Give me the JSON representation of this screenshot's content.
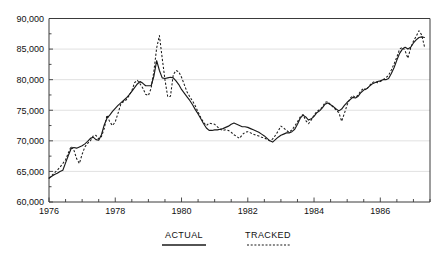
{
  "chart_data": {
    "type": "line",
    "title": "",
    "subtitle": "",
    "xlabel": "",
    "ylabel": "",
    "grid": true,
    "legend_position": "bottom",
    "ylim": [
      60000,
      90000
    ],
    "yticks": [
      60000,
      65000,
      70000,
      75000,
      80000,
      85000,
      90000
    ],
    "ytick_labels": [
      "60,000",
      "65,000",
      "70,000",
      "75,000",
      "80,000",
      "85,000",
      "90,000"
    ],
    "xlim": [
      1976.0,
      1987.5
    ],
    "xticks": [
      1976,
      1978,
      1980,
      1982,
      1984,
      1986
    ],
    "xtick_labels": [
      "1976",
      "1978",
      "1980",
      "1982",
      "1984",
      "1986"
    ],
    "xtick_minor_interval": 0.5,
    "x": [
      1976.0,
      1976.083,
      1976.167,
      1976.25,
      1976.333,
      1976.417,
      1976.5,
      1976.583,
      1976.667,
      1976.75,
      1976.833,
      1976.917,
      1977.0,
      1977.083,
      1977.167,
      1977.25,
      1977.333,
      1977.417,
      1977.5,
      1977.583,
      1977.667,
      1977.75,
      1977.833,
      1977.917,
      1978.0,
      1978.083,
      1978.167,
      1978.25,
      1978.333,
      1978.417,
      1978.5,
      1978.583,
      1978.667,
      1978.75,
      1978.833,
      1978.917,
      1979.0,
      1979.083,
      1979.167,
      1979.25,
      1979.333,
      1979.417,
      1979.5,
      1979.583,
      1979.667,
      1979.75,
      1979.833,
      1979.917,
      1980.0,
      1980.083,
      1980.167,
      1980.25,
      1980.333,
      1980.417,
      1980.5,
      1980.583,
      1980.667,
      1980.75,
      1980.833,
      1980.917,
      1981.0,
      1981.083,
      1981.167,
      1981.25,
      1981.333,
      1981.417,
      1981.5,
      1981.583,
      1981.667,
      1981.75,
      1981.833,
      1981.917,
      1982.0,
      1982.083,
      1982.167,
      1982.25,
      1982.333,
      1982.417,
      1982.5,
      1982.583,
      1982.667,
      1982.75,
      1982.833,
      1982.917,
      1983.0,
      1983.083,
      1983.167,
      1983.25,
      1983.333,
      1983.417,
      1983.5,
      1983.583,
      1983.667,
      1983.75,
      1983.833,
      1983.917,
      1984.0,
      1984.083,
      1984.167,
      1984.25,
      1984.333,
      1984.417,
      1984.5,
      1984.583,
      1984.667,
      1984.75,
      1984.833,
      1984.917,
      1985.0,
      1985.083,
      1985.167,
      1985.25,
      1985.333,
      1985.417,
      1985.5,
      1985.583,
      1985.667,
      1985.75,
      1985.833,
      1985.917,
      1986.0,
      1986.083,
      1986.167,
      1986.25,
      1986.333,
      1986.417,
      1986.5,
      1986.583,
      1986.667,
      1986.75,
      1986.833,
      1986.917,
      1987.0,
      1987.083,
      1987.167,
      1987.25,
      1987.333
    ],
    "series": [
      {
        "name": "ACTUAL",
        "style": "solid",
        "color": "#1a1a1a",
        "values": [
          63900,
          64200,
          64500,
          64700,
          65000,
          65200,
          66400,
          67600,
          68700,
          68900,
          68800,
          69000,
          69200,
          69500,
          69900,
          70400,
          70600,
          70200,
          70100,
          71000,
          72600,
          73700,
          74200,
          74800,
          75300,
          75800,
          76200,
          76600,
          77000,
          77500,
          78100,
          78700,
          79300,
          79700,
          79400,
          79000,
          79000,
          79000,
          80600,
          83100,
          81500,
          80300,
          80200,
          80300,
          80400,
          80300,
          79800,
          79200,
          78400,
          77800,
          77200,
          76600,
          75900,
          75100,
          74400,
          73600,
          72800,
          72100,
          71700,
          71700,
          71800,
          71800,
          71900,
          72000,
          72200,
          72400,
          72700,
          72900,
          72700,
          72500,
          72300,
          72300,
          72200,
          72000,
          71800,
          71600,
          71400,
          71100,
          70800,
          70400,
          70000,
          69800,
          70200,
          70600,
          70900,
          71100,
          71300,
          71300,
          71500,
          71900,
          72700,
          73700,
          74200,
          73900,
          73400,
          73600,
          74000,
          74600,
          74900,
          75400,
          76000,
          76200,
          75900,
          75600,
          75200,
          74900,
          75200,
          75800,
          76300,
          76700,
          77100,
          77000,
          77300,
          77900,
          78300,
          78500,
          78900,
          79300,
          79500,
          79700,
          79800,
          80000,
          80000,
          80200,
          81000,
          82000,
          83200,
          84300,
          85000,
          85300,
          85000,
          85300,
          86000,
          86500,
          86900,
          87000,
          86900
        ]
      },
      {
        "name": "TRACKED",
        "style": "dashed",
        "color": "#1a1a1a",
        "values": [
          63900,
          64300,
          64800,
          65200,
          65700,
          66300,
          66900,
          68000,
          69100,
          68500,
          67100,
          66300,
          67800,
          69000,
          69600,
          70000,
          70800,
          70900,
          70300,
          70700,
          72000,
          74200,
          73100,
          72500,
          73100,
          74500,
          76000,
          76400,
          76700,
          77400,
          78200,
          79500,
          79900,
          79300,
          78600,
          77600,
          77400,
          78600,
          81400,
          85200,
          87200,
          83500,
          80000,
          77200,
          77300,
          80800,
          81500,
          81300,
          80400,
          79200,
          78000,
          77200,
          76500,
          75700,
          74700,
          73800,
          73000,
          72500,
          72900,
          72800,
          72700,
          72300,
          71900,
          71700,
          71800,
          71700,
          71400,
          71000,
          70700,
          70400,
          71000,
          71400,
          71500,
          71300,
          71100,
          70900,
          70800,
          70600,
          70500,
          70200,
          70000,
          70300,
          70900,
          71600,
          72400,
          72100,
          71700,
          71400,
          71800,
          72400,
          73100,
          73900,
          74300,
          73300,
          72800,
          73400,
          74200,
          74800,
          75100,
          75500,
          76300,
          76400,
          75900,
          75500,
          75000,
          74600,
          73200,
          74500,
          75900,
          76900,
          77400,
          77100,
          77500,
          78200,
          78600,
          78300,
          79000,
          79500,
          79700,
          79500,
          79700,
          80000,
          80300,
          80700,
          81600,
          82600,
          83700,
          85000,
          85300,
          84700,
          83500,
          85200,
          86300,
          87100,
          88000,
          87300,
          85400
        ]
      }
    ]
  },
  "legend": {
    "items": [
      {
        "label": "ACTUAL",
        "style": "solid"
      },
      {
        "label": "TRACKED",
        "style": "dashed"
      }
    ]
  }
}
